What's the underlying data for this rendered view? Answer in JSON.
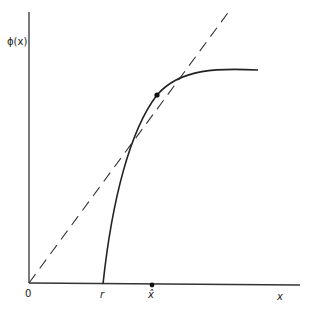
{
  "diagram": {
    "y_axis_label": "ϕ(x)",
    "x_axis_label": "x",
    "origin_label": "0",
    "r_label": "r",
    "xhat_label": "x̂",
    "elements": [
      "y-axis",
      "x-axis",
      "dashed 45-degree line from origin",
      "concave curve phi(x) starting at r",
      "intersection point (fixed point)",
      "x-hat marker on x-axis"
    ],
    "colors": {
      "line": "#222222",
      "background": "#ffffff"
    }
  }
}
